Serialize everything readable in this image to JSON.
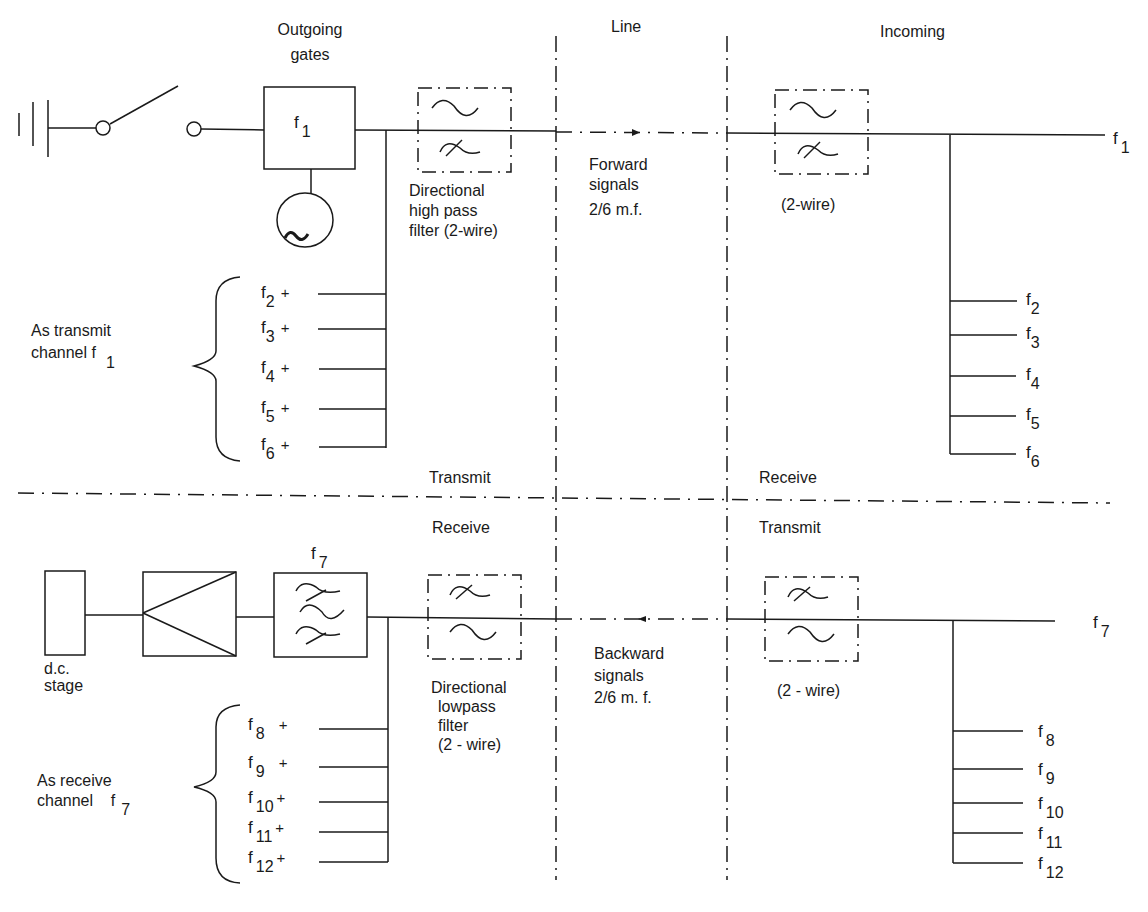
{
  "diagram": {
    "regions": {
      "line": "Line",
      "incoming": "Incoming",
      "outgoing_gates": [
        "Outgoing",
        "gates"
      ]
    },
    "top_section": {
      "gate_label": {
        "f": "f",
        "sub": "1"
      },
      "highpass_filter_caption": [
        "Directional",
        "high pass",
        "filter (2-wire)"
      ],
      "forward_signals": [
        "Forward",
        "signals",
        "2/6 m.f."
      ],
      "incoming_filter_caption": "(2-wire)",
      "line_end_label": {
        "f": "f",
        "sub": "1"
      },
      "transmit_channel_label": [
        "As transmit",
        "channel  f"
      ],
      "transmit_channel_sub": "1",
      "left_inputs": [
        {
          "f": "f",
          "sub": "2",
          "suffix": "+"
        },
        {
          "f": "f",
          "sub": "3",
          "suffix": "+"
        },
        {
          "f": "f",
          "sub": "4",
          "suffix": "+"
        },
        {
          "f": "f",
          "sub": "5",
          "suffix": "+"
        },
        {
          "f": "f",
          "sub": "6",
          "suffix": "+"
        }
      ],
      "right_outputs": [
        {
          "f": "f",
          "sub": "2"
        },
        {
          "f": "f",
          "sub": "3"
        },
        {
          "f": "f",
          "sub": "4"
        },
        {
          "f": "f",
          "sub": "5"
        },
        {
          "f": "f",
          "sub": "6"
        }
      ]
    },
    "divider_labels": {
      "left_upper": "Transmit",
      "right_upper": "Receive",
      "left_lower": "Receive",
      "right_lower": "Transmit"
    },
    "bottom_section": {
      "dc_stage": [
        "d.c.",
        "stage"
      ],
      "bandpass_label": {
        "f": "f",
        "sub": "7"
      },
      "lowpass_filter_caption": [
        "Directional",
        "lowpass",
        "filter",
        "(2 - wire)"
      ],
      "backward_signals": [
        "Backward",
        "signals",
        "2/6 m. f."
      ],
      "outgoing_filter_caption": "(2 - wire)",
      "line_end_label": {
        "f": "f",
        "sub": "7"
      },
      "receive_channel_label": [
        "As receive",
        "channel    f"
      ],
      "receive_channel_sub": "7",
      "left_inputs": [
        {
          "f": "f",
          "sub": "8",
          "suffix": "+"
        },
        {
          "f": "f",
          "sub": "9",
          "suffix": "+"
        },
        {
          "f": "f",
          "sub": "10",
          "suffix": "+"
        },
        {
          "f": "f",
          "sub": "11",
          "suffix": "+"
        },
        {
          "f": "f",
          "sub": "12",
          "suffix": "+"
        }
      ],
      "right_outputs": [
        {
          "f": "f",
          "sub": "8"
        },
        {
          "f": "f",
          "sub": "9"
        },
        {
          "f": "f",
          "sub": "10"
        },
        {
          "f": "f",
          "sub": "11"
        },
        {
          "f": "f",
          "sub": "12"
        }
      ]
    },
    "colors": {
      "ink": "#1a1a1a",
      "background": "#ffffff"
    }
  }
}
